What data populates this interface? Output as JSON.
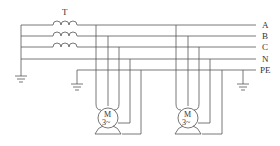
{
  "diagram": {
    "type": "electrical-schematic",
    "transformer_label": "T",
    "bus_labels": [
      "A",
      "B",
      "C",
      "N",
      "PE"
    ],
    "motors": [
      {
        "label_top": "M",
        "label_bottom": "3~"
      },
      {
        "label_top": "M",
        "label_bottom": "3~"
      }
    ],
    "stroke_color": "#555555",
    "text_color": "#333333"
  }
}
